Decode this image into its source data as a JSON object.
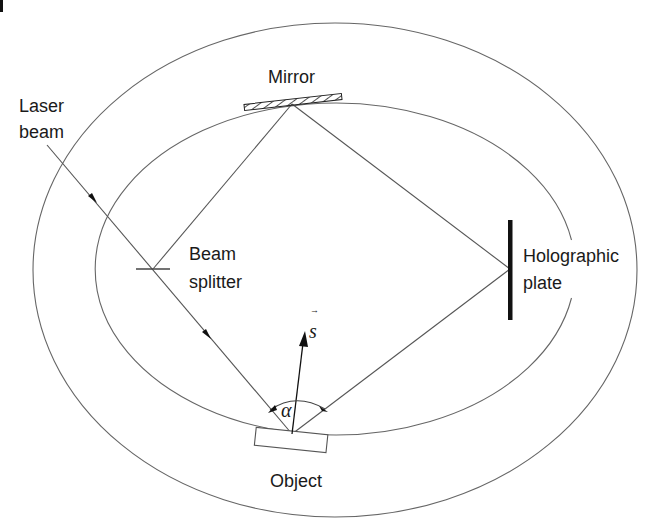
{
  "diagram": {
    "labels": {
      "laser_beam_line1": "Laser",
      "laser_beam_line2": "beam",
      "mirror": "Mirror",
      "beam_splitter_line1": "Beam",
      "beam_splitter_line2": "splitter",
      "holographic_plate_line1": "Holographic",
      "holographic_plate_line2": "plate",
      "object": "Object",
      "s_vector": "s",
      "s_vector_accent": "→",
      "angle": "α"
    },
    "components": [
      {
        "id": "laser-beam",
        "type": "incoming ray",
        "from": [
          47,
          145
        ],
        "to": [
          292,
          434
        ]
      },
      {
        "id": "beam-splitter",
        "type": "splitter",
        "position": [
          153,
          269
        ]
      },
      {
        "id": "mirror",
        "type": "mirror",
        "from": [
          244,
          108
        ],
        "to": [
          342,
          97
        ]
      },
      {
        "id": "holographic-plate",
        "type": "plate",
        "x": 510,
        "y_range": [
          220,
          320
        ]
      },
      {
        "id": "object",
        "type": "object",
        "center": [
          291,
          441
        ]
      }
    ],
    "rays": [
      {
        "name": "splitter-to-mirror",
        "from": [
          153,
          269
        ],
        "to": [
          292,
          104
        ]
      },
      {
        "name": "mirror-to-plate",
        "from": [
          292,
          104
        ],
        "to": [
          510,
          269
        ]
      },
      {
        "name": "object-to-plate",
        "from": [
          292,
          434
        ],
        "to": [
          510,
          269
        ]
      }
    ],
    "ellipses": [
      {
        "name": "outer",
        "cx": 335,
        "cy": 270,
        "rx": 302,
        "ry": 247
      },
      {
        "name": "inner",
        "cx": 333,
        "cy": 268,
        "rx": 240,
        "ry": 166
      }
    ],
    "colors": {
      "line": "#555555",
      "ellipse": "#666666",
      "plate": "#111111",
      "text": "#1a1a1a"
    }
  }
}
